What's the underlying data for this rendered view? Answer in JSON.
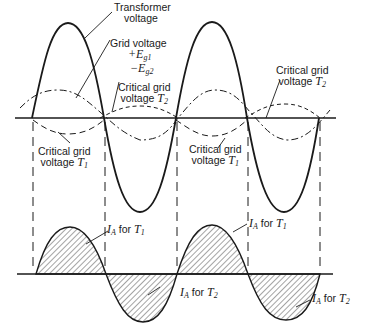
{
  "figure": {
    "labels": {
      "transformer_voltage": [
        "Transformer",
        "voltage"
      ],
      "grid_voltage": {
        "title": "Grid voltage",
        "plus": "+E",
        "plus_sub": "g1",
        "minus": "−E",
        "minus_sub": "g2"
      },
      "critical_t2_a": {
        "line1": "Critical grid",
        "line2": "voltage ",
        "var": "T",
        "sub": "2"
      },
      "critical_t2_b": {
        "line1": "Critical grid",
        "line2": "voltage ",
        "var": "T",
        "sub": "2"
      },
      "critical_t1_a": {
        "line1": "Critical grid",
        "line2": "voltage ",
        "var": "T",
        "sub": "1"
      },
      "critical_t1_b": {
        "line1": "Critical grid",
        "line2": "voltage ",
        "var": "T",
        "sub": "1"
      },
      "ia_t1_a": {
        "var": "I",
        "sub": "A",
        "text": " for ",
        "var2": "T",
        "sub2": "1"
      },
      "ia_t1_b": {
        "var": "I",
        "sub": "A",
        "text": " for ",
        "var2": "T",
        "sub2": "1"
      },
      "ia_t2_a": {
        "var": "I",
        "sub": "A",
        "text": " for ",
        "var2": "T",
        "sub2": "2"
      },
      "ia_t2_b": {
        "var": "I",
        "sub": "A",
        "text": " for ",
        "var2": "T",
        "sub2": "2"
      }
    },
    "colors": {
      "ink": "#1a1a1a",
      "paper": "#ffffff"
    },
    "waveforms": {
      "transformer_voltage_zero_crossings_px": [
        32,
        104,
        176,
        247,
        319
      ],
      "upper_axis_y_px": 118,
      "lower_axis_y_px": 274,
      "dashed_verticals_x_px": [
        33,
        105,
        177,
        248,
        320
      ]
    }
  }
}
